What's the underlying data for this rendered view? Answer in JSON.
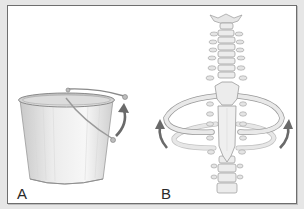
{
  "figure": {
    "panels": [
      {
        "id": "A",
        "label": "A",
        "subject": "bucket with handle",
        "icon": "bucket-icon",
        "arrow": "curved-up-arrow"
      },
      {
        "id": "B",
        "label": "B",
        "subject": "spine and ribcage",
        "icon": "spine-ribcage-icon",
        "arrows": [
          "curved-up-arrow-left",
          "curved-up-arrow-right"
        ]
      }
    ],
    "colors": {
      "background": "#e6e6e6",
      "panel": "#ffffff",
      "border": "#6e6e6e",
      "arrow": "#6a6a6a",
      "bone_fill": "#ececec",
      "bone_stroke": "#9a9a9a",
      "bucket_fill": "#e2e2e2"
    }
  }
}
